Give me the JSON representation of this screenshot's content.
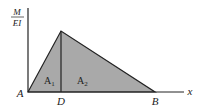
{
  "diagram": {
    "y_axis_label": {
      "numerator": "M",
      "denominator": "EI"
    },
    "x_axis_label": "x",
    "points": {
      "A": "A",
      "D": "D",
      "B": "B"
    },
    "areas": [
      {
        "name": "A",
        "subscript": "1"
      },
      {
        "name": "A",
        "subscript": "2"
      }
    ],
    "fill_color": "#a9a9a9",
    "line_color": "#222222"
  }
}
